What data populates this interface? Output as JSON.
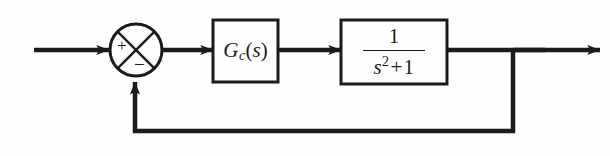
{
  "figure": {
    "kind": "block-diagram",
    "background_color": "#fefefe",
    "line_color": "#1b1b1b"
  },
  "summing_junction": {
    "name": "summing-junction",
    "shape": "circle-with-x-cross",
    "plus_sign": "+",
    "minus_sign": "−",
    "plus_position": "upper-left-quadrant",
    "minus_position": "lower-quadrant"
  },
  "blocks": [
    {
      "id": "controller",
      "label_text": "G_c(s)",
      "label_main": "G",
      "label_sub": "c",
      "label_paren_open": "(",
      "label_var": "s",
      "label_paren_close": ")"
    },
    {
      "id": "plant",
      "label_text": "1/(s^2 + 1)",
      "numerator": "1",
      "denominator_var": "s",
      "denominator_exponent": "2",
      "denominator_operator": "+",
      "denominator_constant": "1"
    }
  ],
  "signals": {
    "input_arrow": "reference-input",
    "error_arrow": "error-signal",
    "control_arrow": "control-signal",
    "output_arrow": "output-signal",
    "feedback_arrow": "unity-feedback"
  }
}
